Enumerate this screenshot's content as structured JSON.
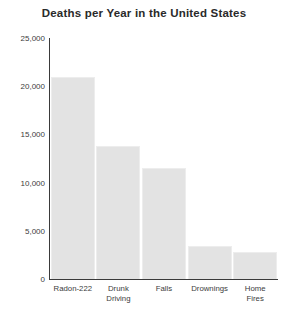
{
  "chart_data": {
    "type": "bar",
    "title": "Deaths per Year in the United States",
    "xlabel": "",
    "ylabel": "",
    "categories": [
      "Radon-222",
      "Drunk\nDriving",
      "Falls",
      "Drownings",
      "Home\nFires"
    ],
    "values": [
      21000,
      13800,
      11500,
      3400,
      2800
    ],
    "ylim": [
      0,
      25000
    ],
    "yticks": [
      0,
      5000,
      10000,
      15000,
      20000,
      25000
    ],
    "ytick_labels": [
      "0",
      "5,000",
      "10,000",
      "15,000",
      "20,000",
      "25,000"
    ],
    "grid": false,
    "legend": "none",
    "bar_color": "#e3e3e3",
    "axis_color": "#3a3a3a",
    "text_color": "#2b2b2b"
  }
}
